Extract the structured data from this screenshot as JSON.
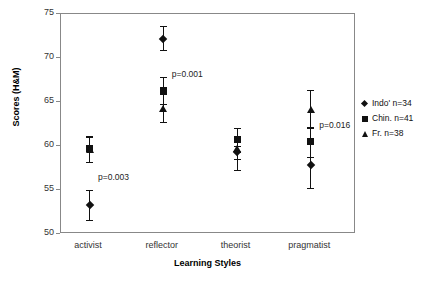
{
  "chart_data": {
    "type": "scatter",
    "title": "",
    "xlabel": "Learning Styles",
    "ylabel": "Scores (H&M)",
    "categories": [
      "activist",
      "reflector",
      "theorist",
      "pragmatist"
    ],
    "ylim": [
      50,
      75
    ],
    "yticks": [
      50,
      55,
      60,
      65,
      70,
      75
    ],
    "ytick_labels": [
      "50",
      "55",
      "60",
      "65",
      "70",
      "75"
    ],
    "grid": false,
    "legend_position": "right-outside",
    "error_bar_type": "95% CI",
    "series": [
      {
        "name": "Indo' n=34",
        "marker": "diamond",
        "n": 34,
        "values": [
          53.3,
          72.2,
          59.3,
          57.8
        ],
        "err_low": [
          51.6,
          70.9,
          57.3,
          55.2
        ],
        "err_high": [
          55.0,
          73.6,
          60.0,
          60.6
        ]
      },
      {
        "name": "Chin. n=41",
        "marker": "square",
        "n": 41,
        "values": [
          59.7,
          66.3,
          60.7,
          60.5
        ],
        "err_low": [
          58.2,
          64.8,
          59.3,
          58.8
        ],
        "err_high": [
          61.1,
          67.8,
          62.0,
          62.2
        ]
      },
      {
        "name": "Fr. n=38",
        "marker": "triangle",
        "n": 38,
        "values": [
          59.6,
          64.3,
          59.7,
          64.2
        ],
        "err_low": [
          58.2,
          62.7,
          58.5,
          62.1
        ],
        "err_high": [
          61.0,
          65.9,
          61.0,
          66.4
        ]
      }
    ],
    "annotations": [
      {
        "text": "p=0.003",
        "category": "activist",
        "value": 56.5
      },
      {
        "text": "p=0.001",
        "category": "reflector",
        "value": 68.2
      },
      {
        "text": "p=0.016",
        "category": "pragmatist",
        "value": 62.4
      }
    ]
  },
  "axes": {
    "y_title": "Scores (H&M)",
    "x_title": "Learning Styles",
    "y_tick_labels": [
      "75",
      "70",
      "65",
      "60",
      "55",
      "50"
    ],
    "x_tick_labels": [
      "activist",
      "reflector",
      "theorist",
      "pragmatist"
    ]
  },
  "annotations": {
    "p_activist": "p=0.003",
    "p_reflector": "p=0.001",
    "p_pragmatist": "p=0.016"
  },
  "legend": {
    "entries": [
      {
        "label": "Indo' n=34",
        "marker": "diamond-icon"
      },
      {
        "label": "Chin. n=41",
        "marker": "square-icon"
      },
      {
        "label": "Fr. n=38",
        "marker": "triangle-icon"
      }
    ]
  },
  "colors": {
    "marker": "#111111",
    "frame": "#888888",
    "text": "#222222"
  }
}
